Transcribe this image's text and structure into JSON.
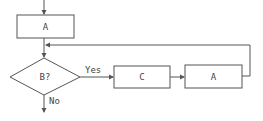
{
  "diagram": {
    "type": "flowchart",
    "nodes": [
      {
        "id": "process-a-1",
        "shape": "rectangle",
        "label": "A"
      },
      {
        "id": "decision-b",
        "shape": "diamond",
        "label": "B?"
      },
      {
        "id": "process-c",
        "shape": "rectangle",
        "label": "C"
      },
      {
        "id": "process-a-2",
        "shape": "rectangle",
        "label": "A"
      }
    ],
    "edges": [
      {
        "from": "start",
        "to": "process-a-1",
        "label": ""
      },
      {
        "from": "process-a-1",
        "to": "decision-b",
        "label": ""
      },
      {
        "from": "decision-b",
        "to": "process-c",
        "label": "Yes"
      },
      {
        "from": "process-c",
        "to": "process-a-2",
        "label": ""
      },
      {
        "from": "process-a-2",
        "to": "decision-b",
        "label": "",
        "note": "loop back above decision"
      },
      {
        "from": "decision-b",
        "to": "exit",
        "label": "No"
      }
    ],
    "labels": {
      "yes": "Yes",
      "no": "No"
    },
    "colors": {
      "stroke": "#555555",
      "text": "#444444",
      "background": "#ffffff"
    }
  }
}
